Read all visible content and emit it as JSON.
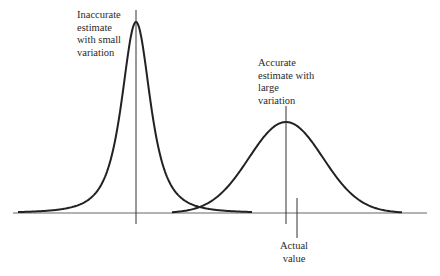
{
  "diagram": {
    "type": "comparison of two distribution curves",
    "baseline": {
      "x1": 13,
      "x2": 427,
      "y": 213
    },
    "curves": [
      {
        "name": "inaccurate-narrow",
        "peak_x": 136,
        "peak_y": 22,
        "sigma": 17,
        "tail": "cauchy-like"
      },
      {
        "name": "accurate-wide",
        "peak_x": 286,
        "peak_y": 122,
        "sigma": 37
      }
    ],
    "markers": {
      "left_peak_line": {
        "x": 136,
        "y1": 10,
        "y2": 224
      },
      "right_peak_line": {
        "x": 286,
        "y1": 106,
        "y2": 224
      },
      "actual_value_line": {
        "x": 297,
        "y1": 198,
        "y2": 238
      }
    }
  },
  "labels": {
    "inaccurate": [
      "Inaccurate",
      "estimate",
      "with small",
      "variation"
    ],
    "accurate": [
      "Accurate",
      "estimate with",
      "large",
      "variation"
    ],
    "actual": [
      "Actual",
      "value"
    ]
  },
  "colors": {
    "line": "#222222",
    "axis": "#555555",
    "text": "#2a2a2a"
  }
}
